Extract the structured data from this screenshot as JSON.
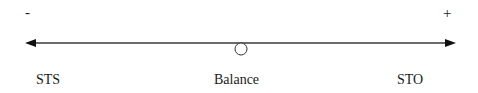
{
  "diagram": {
    "type": "continuum-scale",
    "left_sign": "-",
    "right_sign": "+",
    "labels": {
      "left": "STS",
      "center": "Balance",
      "right": "STO"
    },
    "colors": {
      "line": "#3a3a3a",
      "text": "#1a1a1a",
      "background": "#ffffff"
    }
  }
}
